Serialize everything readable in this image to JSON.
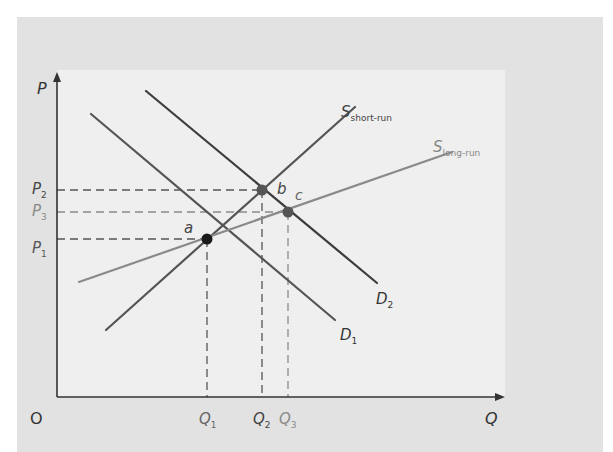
{
  "chart_data": {
    "type": "line",
    "title": "",
    "xlabel": "Q",
    "ylabel": "P",
    "origin_label": "O",
    "grid": false,
    "legend_position": "inline labels",
    "series": [
      {
        "name": "D1",
        "label": "D",
        "sub": "1",
        "color": "#555555",
        "points": [
          [
            91,
            114
          ],
          [
            335,
            320
          ]
        ]
      },
      {
        "name": "D2",
        "label": "D",
        "sub": "2",
        "color": "#3c3c3c",
        "points": [
          [
            146,
            91
          ],
          [
            377,
            283
          ]
        ]
      },
      {
        "name": "S short-run",
        "label": "S",
        "sub": "short-run",
        "color": "#555555",
        "points": [
          [
            106,
            330
          ],
          [
            355,
            107
          ]
        ]
      },
      {
        "name": "S long-run",
        "label": "S",
        "sub": "long-run",
        "color": "#8a8a8a",
        "points": [
          [
            79,
            282
          ],
          [
            452,
            152
          ]
        ]
      }
    ],
    "equilibria": [
      {
        "name": "a",
        "x": 207,
        "y": 239,
        "price": "P1",
        "quantity": "Q1",
        "color": "#1a1a1a"
      },
      {
        "name": "b",
        "x": 262,
        "y": 190,
        "price": "P2",
        "quantity": "Q2",
        "color": "#555555"
      },
      {
        "name": "c",
        "x": 288,
        "y": 212,
        "price": "P3",
        "quantity": "Q3",
        "color": "#555555"
      }
    ],
    "y_tick_labels": [
      {
        "label": "P",
        "sub": "2",
        "y": 190,
        "color": "#444444"
      },
      {
        "label": "P",
        "sub": "3",
        "y": 212,
        "color": "#8a8a8a"
      },
      {
        "label": "P",
        "sub": "1",
        "y": 237,
        "color": "#555555"
      }
    ],
    "x_tick_labels": [
      {
        "label": "Q",
        "sub": "1",
        "x": 207,
        "color": "#666666"
      },
      {
        "label": "Q",
        "sub": "2",
        "x": 261,
        "color": "#444444"
      },
      {
        "label": "Q",
        "sub": "3",
        "x": 287,
        "color": "#8a8a8a"
      }
    ],
    "axes": {
      "x_axis_y": 397,
      "y_axis_x": 57,
      "x_end": 505,
      "y_top": 70
    }
  }
}
